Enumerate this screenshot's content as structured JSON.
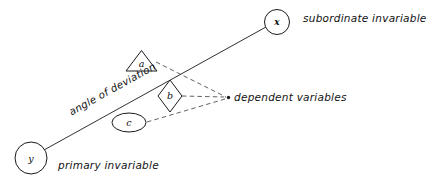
{
  "diagram": {
    "ink_color": "#1a1a1a",
    "dash_color": "#3a3a3a",
    "background": "#ffffff",
    "nodes": {
      "x": {
        "label": "x",
        "shape": "circle",
        "name": "node-x-circle"
      },
      "y": {
        "label": "y",
        "shape": "circle",
        "name": "node-y-circle"
      },
      "a": {
        "label": "a",
        "shape": "triangle",
        "name": "node-a-triangle"
      },
      "b": {
        "label": "b",
        "shape": "diamond",
        "name": "node-b-diamond"
      },
      "c": {
        "label": "c",
        "shape": "ellipse",
        "name": "node-c-ellipse"
      }
    },
    "captions": {
      "subordinate": "subordinate  invariable",
      "primary": "primary  invariable",
      "dependent": "dependent  variables",
      "angle": "angle of deviation"
    }
  }
}
